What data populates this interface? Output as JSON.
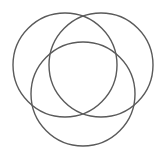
{
  "diagram": {
    "type": "three-circle-venn",
    "width": 159,
    "height": 154,
    "background": "#ffffff",
    "stroke_color": "#5a5a5a",
    "circles": [
      {
        "name": "left",
        "cx": 65,
        "cy": 65,
        "r": 52
      },
      {
        "name": "right",
        "cx": 101,
        "cy": 65,
        "r": 52
      },
      {
        "name": "bottom",
        "cx": 83,
        "cy": 94,
        "r": 52
      }
    ]
  }
}
